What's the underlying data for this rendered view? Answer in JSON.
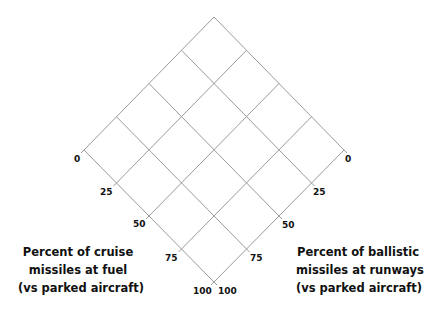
{
  "diagram": {
    "type": "ternary-style diamond grid (4x4)",
    "divisions": 4,
    "line_color": "#9a9a9a",
    "vertices": {
      "top": [
        214,
        17
      ],
      "left": [
        84,
        150
      ],
      "right": [
        344,
        150
      ],
      "bottom": [
        214,
        282
      ]
    }
  },
  "left_axis": {
    "title_lines": [
      "Percent of cruise",
      "missiles at fuel",
      "(vs parked aircraft)"
    ],
    "ticks": [
      "0",
      "25",
      "50",
      "75",
      "100"
    ]
  },
  "right_axis": {
    "title_lines": [
      "Percent of ballistic",
      "missiles at runways",
      "(vs parked aircraft)"
    ],
    "ticks": [
      "0",
      "25",
      "50",
      "75",
      "100"
    ]
  }
}
